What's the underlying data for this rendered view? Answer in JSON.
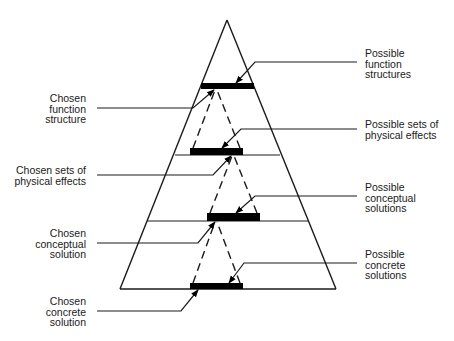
{
  "diagram": {
    "title": "",
    "type": "solution-space-pyramid",
    "colors": {
      "background": "#ffffff",
      "stroke": "#1a1a1a",
      "bar": "#000000"
    },
    "labels_left": [
      {
        "id": "chosen-function-structure",
        "text": "Chosen\nfunction\nstructure"
      },
      {
        "id": "chosen-sets-of-physical-effects",
        "text": "Chosen sets of\nphysical effects"
      },
      {
        "id": "chosen-conceptual-solution",
        "text": "Chosen\nconceptual\nsolution"
      },
      {
        "id": "chosen-concrete-solution",
        "text": "Chosen\nconcrete\nsolution"
      }
    ],
    "labels_right": [
      {
        "id": "possible-function-structures",
        "text": "Possible\nfunction\nstructures"
      },
      {
        "id": "possible-sets-of-physical-effects",
        "text": "Possible sets of\nphysical effects"
      },
      {
        "id": "possible-conceptual-solutions",
        "text": "Possible\nconceptual\nsolutions"
      },
      {
        "id": "possible-concrete-solutions",
        "text": "Possible\nconcrete\nsolutions"
      }
    ],
    "levels": [
      {
        "name": "function structures",
        "order": 1
      },
      {
        "name": "sets of physical effects",
        "order": 2
      },
      {
        "name": "conceptual solutions",
        "order": 3
      },
      {
        "name": "concrete solutions",
        "order": 4
      }
    ]
  }
}
